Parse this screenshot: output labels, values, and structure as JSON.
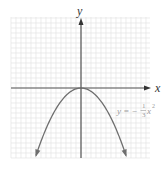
{
  "chart_data": {
    "type": "line",
    "title": "",
    "xlabel": "x",
    "ylabel": "y",
    "xlim": [
      -7,
      7
    ],
    "ylim": [
      -7,
      7
    ],
    "grid": true,
    "grid_step": 1,
    "series": [
      {
        "name": "y = -(1/3)x^2",
        "function": "-(1/3)*x^2",
        "x": [
          -4.5,
          -4,
          -3,
          -2,
          -1,
          0,
          1,
          2,
          3,
          4,
          4.5
        ],
        "y": [
          -6.75,
          -5.33,
          -3,
          -1.33,
          -0.33,
          0,
          -0.33,
          -1.33,
          -3,
          -5.33,
          -6.75
        ],
        "arrows_at_ends": true
      }
    ],
    "annotations": [
      {
        "text": "y = −(1/3)x²",
        "x": 5,
        "y": -2.3
      }
    ]
  },
  "labels": {
    "x_axis": "x",
    "y_axis": "y",
    "equation_lhs": "y = −",
    "equation_num": "1",
    "equation_den": "3",
    "equation_var": "x",
    "equation_exp": "2"
  },
  "colors": {
    "grid": "#e4e4e4",
    "axis": "#555555",
    "curve": "#6e6e6e",
    "label": "#9a9a9a"
  }
}
